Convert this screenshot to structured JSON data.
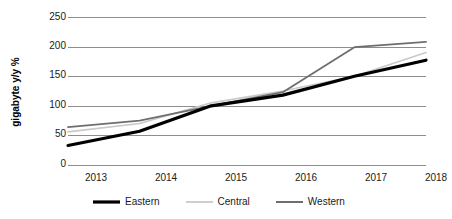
{
  "chart_data": {
    "type": "line",
    "title": "",
    "xlabel": "",
    "ylabel": "gigabyte y/y %",
    "categories": [
      "2013",
      "2014",
      "2015",
      "2016",
      "2017",
      "2018"
    ],
    "ylim": [
      0,
      250
    ],
    "yticks": [
      0,
      50,
      100,
      150,
      200,
      250
    ],
    "grid": true,
    "legend_position": "bottom",
    "series": [
      {
        "name": "Eastern",
        "color": "#000000",
        "width": 3.2,
        "values": [
          33,
          57,
          100,
          118,
          150,
          177
        ]
      },
      {
        "name": "Central",
        "color": "#c9c9c9",
        "width": 1.6,
        "values": [
          56,
          70,
          105,
          125,
          150,
          190
        ]
      },
      {
        "name": "Western",
        "color": "#6e6e6e",
        "width": 1.8,
        "values": [
          64,
          75,
          100,
          123,
          199,
          208
        ]
      }
    ]
  },
  "axis": {
    "y_tick_labels": [
      "250",
      "200",
      "150",
      "100",
      "50",
      "0"
    ],
    "x_tick_labels": [
      "2013",
      "2014",
      "2015",
      "2016",
      "2017",
      "2018"
    ],
    "y_title": "gigabyte y/y %"
  },
  "legend": {
    "items": [
      {
        "label": "Eastern"
      },
      {
        "label": "Central"
      },
      {
        "label": "Western"
      }
    ]
  },
  "style": {
    "gridline_color": "#8d8d8d",
    "background": "#ffffff",
    "text_color": "#1a1a1a"
  }
}
